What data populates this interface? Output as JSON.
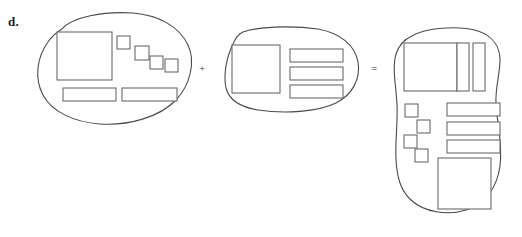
{
  "figure": {
    "label": "d.",
    "background_color": "#ffffff",
    "outline_color": "#4a4a4a",
    "rect_stroke_color": "#6b6b6b",
    "rect_fill_color": "#ffffff"
  },
  "operators": [
    {
      "name": "plus",
      "symbol": "+",
      "x": 199,
      "y": 63
    },
    {
      "name": "equals",
      "symbol": "=",
      "x": 371,
      "y": 63
    }
  ],
  "blobs": [
    {
      "id": "blob-left",
      "role": "first-operand",
      "outline_path": "M 62 29 C 72 17, 104 11, 133 13 C 158 15, 179 26, 188 45 C 196 62, 190 85, 176 100 C 160 117, 128 126, 100 124 C 74 122, 52 112, 43 95 C 34 78, 37 57, 48 42 C 52 36, 57 32, 62 29 Z",
      "rects": [
        {
          "name": "large-square",
          "x": 57,
          "y": 32,
          "w": 55,
          "h": 48
        },
        {
          "name": "small-square-1",
          "x": 117,
          "y": 36,
          "w": 13,
          "h": 13
        },
        {
          "name": "small-square-2",
          "x": 135,
          "y": 46,
          "w": 14,
          "h": 14
        },
        {
          "name": "small-square-3",
          "x": 150,
          "y": 56,
          "w": 13,
          "h": 13
        },
        {
          "name": "small-square-4",
          "x": 165,
          "y": 59,
          "w": 13,
          "h": 13
        },
        {
          "name": "bottom-bar-left",
          "x": 63,
          "y": 88,
          "w": 53,
          "h": 13
        },
        {
          "name": "bottom-bar-right",
          "x": 122,
          "y": 88,
          "w": 55,
          "h": 13
        }
      ]
    },
    {
      "id": "blob-middle",
      "role": "second-operand",
      "outline_path": "M 243 32 C 256 27, 290 25, 318 29 C 340 33, 355 45, 358 62 C 361 79, 352 95, 336 103 C 318 112, 284 114, 258 110 C 240 107, 229 100, 226 88 C 223 74, 227 55, 234 42 C 236 37, 239 34, 243 32 Z",
      "rects": [
        {
          "name": "left-square",
          "x": 232,
          "y": 45,
          "w": 48,
          "h": 48
        },
        {
          "name": "bar-1",
          "x": 290,
          "y": 49,
          "w": 53,
          "h": 13
        },
        {
          "name": "bar-2",
          "x": 290,
          "y": 67,
          "w": 53,
          "h": 13
        },
        {
          "name": "bar-3",
          "x": 290,
          "y": 85,
          "w": 53,
          "h": 13
        }
      ]
    },
    {
      "id": "blob-right",
      "role": "result",
      "outline_path": "M 412 36 C 425 28, 457 25, 478 31 C 493 36, 500 47, 500 60 C 500 74, 495 88, 496 104 C 497 124, 503 144, 500 166 C 497 188, 485 204, 466 210 C 447 216, 424 212, 411 200 C 400 190, 397 176, 396 160 C 395 140, 398 122, 397 104 C 396 86, 392 68, 396 54 C 399 45, 405 39, 412 36 Z",
      "rects": [
        {
          "name": "top-large-square",
          "x": 404,
          "y": 43,
          "w": 53,
          "h": 48
        },
        {
          "name": "top-narrow-bar-inner",
          "x": 457,
          "y": 43,
          "w": 12,
          "h": 48
        },
        {
          "name": "top-narrow-bar-outer",
          "x": 473,
          "y": 43,
          "w": 12,
          "h": 48
        },
        {
          "name": "small-square-1",
          "x": 405,
          "y": 104,
          "w": 13,
          "h": 13
        },
        {
          "name": "small-square-2",
          "x": 417,
          "y": 120,
          "w": 13,
          "h": 13
        },
        {
          "name": "small-square-3",
          "x": 404,
          "y": 135,
          "w": 13,
          "h": 13
        },
        {
          "name": "small-square-4",
          "x": 415,
          "y": 149,
          "w": 13,
          "h": 13
        },
        {
          "name": "bar-1",
          "x": 447,
          "y": 103,
          "w": 53,
          "h": 13
        },
        {
          "name": "bar-2",
          "x": 447,
          "y": 122,
          "w": 53,
          "h": 13
        },
        {
          "name": "bar-3",
          "x": 447,
          "y": 140,
          "w": 53,
          "h": 13
        },
        {
          "name": "bottom-large-square",
          "x": 438,
          "y": 158,
          "w": 53,
          "h": 51
        }
      ]
    }
  ]
}
